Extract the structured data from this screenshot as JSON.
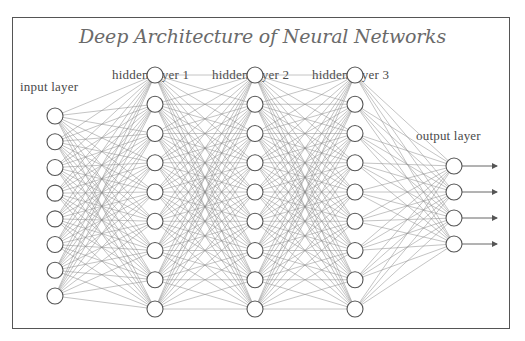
{
  "diagram": {
    "title": "Deep Architecture of Neural Networks",
    "layers": [
      {
        "id": "input",
        "label": "input layer",
        "nodes": 8,
        "x": 55,
        "y_top": 116,
        "y_bottom": 296,
        "label_x": 20,
        "label_y": 79
      },
      {
        "id": "hidden1",
        "label": "hidden layer 1",
        "nodes": 9,
        "x": 155,
        "y_top": 75,
        "y_bottom": 309,
        "label_x": 112,
        "label_y": 67
      },
      {
        "id": "hidden2",
        "label": "hidden layer 2",
        "nodes": 9,
        "x": 255,
        "y_top": 75,
        "y_bottom": 309,
        "label_x": 212,
        "label_y": 67
      },
      {
        "id": "hidden3",
        "label": "hidden layer 3",
        "nodes": 9,
        "x": 355,
        "y_top": 75,
        "y_bottom": 309,
        "label_x": 312,
        "label_y": 67
      },
      {
        "id": "output",
        "label": "output layer",
        "nodes": 4,
        "x": 454,
        "y_top": 166,
        "y_bottom": 244,
        "label_x": 416,
        "label_y": 128
      }
    ],
    "node_radius": 8,
    "output_arrow_end_x": 497,
    "colors": {
      "edge": "#8a8a8a",
      "node_stroke": "#555555",
      "node_fill": "#ffffff",
      "frame": "#555555",
      "title": "#6a6a6a",
      "label": "#4a4a4a"
    }
  }
}
